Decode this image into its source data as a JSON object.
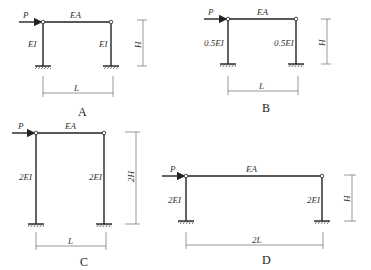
{
  "figures": [
    {
      "caption": "A",
      "load": "P",
      "beam": "EA",
      "left_col": "EI",
      "right_col": "EI",
      "height": "H",
      "span": "L"
    },
    {
      "caption": "B",
      "load": "P",
      "beam": "EA",
      "left_col": "0.5EI",
      "right_col": "0.5EI",
      "height": "H",
      "span": "L"
    },
    {
      "caption": "C",
      "load": "P",
      "beam": "EA",
      "left_col": "2EI",
      "right_col": "2EI",
      "height": "2H",
      "span": "L"
    },
    {
      "caption": "D",
      "load": "P",
      "beam": "EA",
      "left_col": "2EI",
      "right_col": "2EI",
      "height": "H",
      "span": "2L"
    }
  ]
}
